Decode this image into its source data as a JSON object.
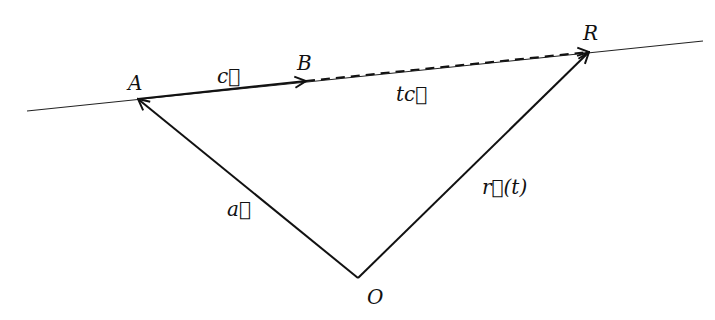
{
  "diagram": {
    "points": {
      "A": {
        "label": "A",
        "x": 138,
        "y": 99
      },
      "B": {
        "label": "B",
        "x": 306,
        "y": 81
      },
      "R": {
        "label": "R",
        "x": 589,
        "y": 52
      },
      "O": {
        "label": "O",
        "x": 358,
        "y": 278
      }
    },
    "vectors": {
      "c": {
        "label": "c⃗",
        "from": "A",
        "to": "B"
      },
      "tc": {
        "label": "tc⃗",
        "from": "B",
        "to": "R",
        "style": "dashed"
      },
      "a": {
        "label": "a⃗",
        "from": "O",
        "to": "A"
      },
      "r": {
        "label": "r⃗(t)",
        "from": "O",
        "to": "R"
      }
    },
    "line": {
      "x1": 27,
      "y1": 111,
      "x2": 703,
      "y2": 41
    },
    "colors": {
      "stroke": "#111111",
      "background": "#ffffff"
    }
  }
}
